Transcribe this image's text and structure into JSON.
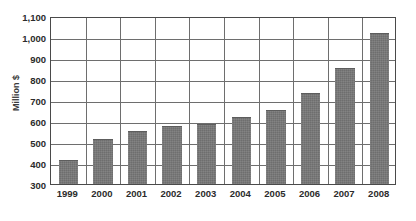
{
  "chart_data": {
    "type": "bar",
    "title": "",
    "subtitle": "",
    "xlabel": "",
    "ylabel": "Million $",
    "categories": [
      "1999",
      "2000",
      "2001",
      "2002",
      "2003",
      "2004",
      "2005",
      "2006",
      "2007",
      "2008"
    ],
    "values": [
      415,
      515,
      555,
      575,
      585,
      620,
      655,
      735,
      855,
      1020
    ],
    "series": [
      {
        "name": "Million $",
        "values": [
          415,
          515,
          555,
          575,
          585,
          620,
          655,
          735,
          855,
          1020
        ]
      }
    ],
    "ylim": [
      300,
      1100
    ],
    "ytick_labels": [
      "300",
      "400",
      "500",
      "600",
      "700",
      "800",
      "900",
      "1,000",
      "1,100"
    ],
    "ytick_values": [
      300,
      400,
      500,
      600,
      700,
      800,
      900,
      1000,
      1100
    ],
    "ytick_step": 100,
    "grid": {
      "horizontal": true,
      "vertical": true
    },
    "legend": {
      "visible": false,
      "position": "none",
      "entries": []
    },
    "annotations": [],
    "colors": {
      "bar_fill": "#787878",
      "bar_edge": "#5d5d5d",
      "grid_line": "#6e6e6e",
      "axis_frame": "#4a4a4a",
      "text": "#2b2b2b",
      "background": "#ffffff"
    },
    "bar_width_ratio": 0.56
  }
}
